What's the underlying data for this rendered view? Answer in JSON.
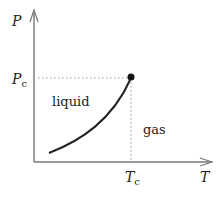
{
  "diagram": {
    "axes": {
      "y_label": "P",
      "x_label": "T",
      "y_tick": {
        "main": "P",
        "sub": "c"
      },
      "x_tick": {
        "main": "T",
        "sub": "c"
      }
    },
    "regions": {
      "liquid": "liquid",
      "gas": "gas"
    },
    "critical_point": {
      "label": "critical point",
      "x": 131,
      "y": 77
    },
    "colors": {
      "axis": "#777777",
      "curve": "#222222",
      "dotted": "#999999",
      "text": "#222222"
    }
  }
}
